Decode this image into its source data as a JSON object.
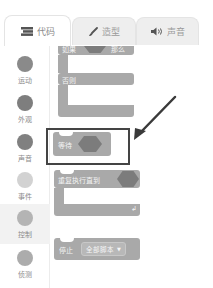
{
  "tabs": [
    {
      "label": "代码",
      "icon": "code-icon",
      "active": true
    },
    {
      "label": "造型",
      "icon": "brush-icon",
      "active": false
    },
    {
      "label": "声音",
      "icon": "speaker-icon",
      "active": false
    }
  ],
  "categories": [
    {
      "label": "运动",
      "color": "#8a8a8a",
      "selected": false
    },
    {
      "label": "外观",
      "color": "#7e7e7e",
      "selected": false
    },
    {
      "label": "声音",
      "color": "#808080",
      "selected": false
    },
    {
      "label": "事件",
      "color": "#d2d2d2",
      "selected": false
    },
    {
      "label": "控制",
      "color": "#b4b4b4",
      "selected": true
    },
    {
      "label": "侦测",
      "color": "#acacac",
      "selected": false
    }
  ],
  "blocks": {
    "if_else": {
      "if_label": "如果",
      "then_label": "那么",
      "else_label": "否则"
    },
    "wait_until": {
      "label": "等待"
    },
    "repeat_until": {
      "label": "重复执行直到"
    },
    "stop": {
      "label": "停止",
      "option": "全部脚本"
    }
  },
  "annotation": {
    "type": "highlight-box-with-arrow",
    "target": "wait_until"
  },
  "colors": {
    "block": "#a9a9a9",
    "slot": "#7c7c7c",
    "highlight_border": "#444444"
  }
}
